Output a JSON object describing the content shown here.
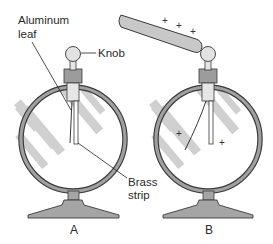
{
  "figure": {
    "type": "diagram",
    "labels": {
      "aluminum_leaf_line1": "Aluminum",
      "aluminum_leaf_line2": "leaf",
      "knob": "Knob",
      "brass_strip_line1": "Brass",
      "brass_strip_line2": "strip"
    },
    "panels": [
      {
        "id": "A",
        "caption": "A",
        "state": "uncharged, leaf hanging against strip"
      },
      {
        "id": "B",
        "caption": "B",
        "state": "charged rod near knob, leaf diverged"
      }
    ],
    "charges": {
      "rod_signs": [
        "+",
        "+",
        "+"
      ],
      "inside_signs": [
        "+",
        "+"
      ]
    },
    "colors": {
      "rim": "#9a9a9a",
      "rim_outline": "#3a3a3a",
      "stripe": "#d0d0d0",
      "metal": "#9c9c9c",
      "knob": "#e2e2e2",
      "rod": "#c8c8c8",
      "base": "#a5a5a5",
      "text": "#2a2a2a"
    }
  }
}
